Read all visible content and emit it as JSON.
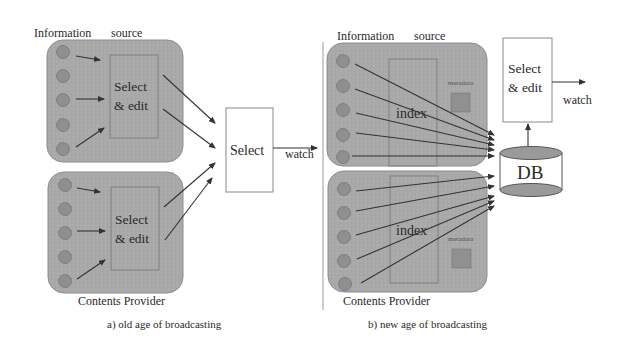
{
  "colors": {
    "provider_fill": "#a8a8a8",
    "provider_stroke": "#8c8c8c",
    "source_circle_fill": "#8f8f8f",
    "arrow": "#333333",
    "box_stroke": "#888888",
    "background": "#ffffff"
  },
  "panel_a": {
    "caption": "a)  old age of broadcasting",
    "header_label_left": "Information",
    "header_label_right": "source",
    "footer_label": "Contents Provider",
    "providers": [
      {
        "sources": 5,
        "process_label_line1": "Select",
        "process_label_line2": "& edit"
      },
      {
        "sources": 5,
        "process_label_line1": "Select",
        "process_label_line2": "& edit"
      }
    ],
    "central_box_label": "Select",
    "output_label": "watch"
  },
  "panel_b": {
    "caption": "b)  new age of broadcasting",
    "header_label_left": "Information",
    "header_label_right": "source",
    "footer_label": "Contents Provider",
    "providers": [
      {
        "sources": 5,
        "index_label": "index",
        "metadata_label": "metadata"
      },
      {
        "sources": 5,
        "index_label": "index",
        "metadata_label": "metadata"
      }
    ],
    "database_label": "DB",
    "select_box_label_line1": "Select",
    "select_box_label_line2": "& edit",
    "output_label": "watch"
  }
}
